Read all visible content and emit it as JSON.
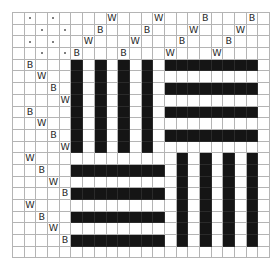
{
  "diagram": {
    "type": "weave-draft-grid",
    "grid": {
      "cols": 22,
      "rows": 21,
      "cell_px": 11.7,
      "line_color": "#b4b4b4",
      "fill_color": "#151515"
    },
    "dots": [
      [
        0,
        1
      ],
      [
        0,
        3
      ],
      [
        1,
        2
      ],
      [
        1,
        4
      ],
      [
        2,
        1
      ],
      [
        2,
        3
      ],
      [
        3,
        2
      ],
      [
        3,
        4
      ]
    ],
    "letters": [
      {
        "row": 0,
        "col": 8,
        "text": "W"
      },
      {
        "row": 0,
        "col": 12,
        "text": "W"
      },
      {
        "row": 0,
        "col": 16,
        "text": "B"
      },
      {
        "row": 0,
        "col": 20,
        "text": "B"
      },
      {
        "row": 1,
        "col": 7,
        "text": "B"
      },
      {
        "row": 1,
        "col": 11,
        "text": "B"
      },
      {
        "row": 1,
        "col": 15,
        "text": "W"
      },
      {
        "row": 1,
        "col": 19,
        "text": "W"
      },
      {
        "row": 2,
        "col": 6,
        "text": "W"
      },
      {
        "row": 2,
        "col": 10,
        "text": "W"
      },
      {
        "row": 2,
        "col": 14,
        "text": "B"
      },
      {
        "row": 2,
        "col": 18,
        "text": "B"
      },
      {
        "row": 3,
        "col": 5,
        "text": "B"
      },
      {
        "row": 3,
        "col": 9,
        "text": "B"
      },
      {
        "row": 3,
        "col": 13,
        "text": "W"
      },
      {
        "row": 3,
        "col": 17,
        "text": "W"
      },
      {
        "row": 4,
        "col": 1,
        "text": "B"
      },
      {
        "row": 5,
        "col": 2,
        "text": "W"
      },
      {
        "row": 6,
        "col": 3,
        "text": "B"
      },
      {
        "row": 7,
        "col": 4,
        "text": "W"
      },
      {
        "row": 8,
        "col": 1,
        "text": "B"
      },
      {
        "row": 9,
        "col": 2,
        "text": "W"
      },
      {
        "row": 10,
        "col": 3,
        "text": "B"
      },
      {
        "row": 11,
        "col": 4,
        "text": "W"
      },
      {
        "row": 12,
        "col": 1,
        "text": "W"
      },
      {
        "row": 13,
        "col": 2,
        "text": "B"
      },
      {
        "row": 14,
        "col": 3,
        "text": "W"
      },
      {
        "row": 15,
        "col": 4,
        "text": "B"
      },
      {
        "row": 16,
        "col": 1,
        "text": "W"
      },
      {
        "row": 17,
        "col": 2,
        "text": "B"
      },
      {
        "row": 18,
        "col": 3,
        "text": "W"
      },
      {
        "row": 19,
        "col": 4,
        "text": "B"
      }
    ],
    "blocks": [
      {
        "name": "top-left-vertical-bars",
        "orientation": "vertical",
        "rows": [
          4,
          11
        ],
        "cols": [
          5,
          7,
          9,
          11
        ]
      },
      {
        "name": "top-right-horizontal-bars",
        "orientation": "horizontal",
        "cols": [
          13,
          20
        ],
        "rows": [
          4,
          6,
          8,
          10
        ]
      },
      {
        "name": "bottom-left-horizontal-bars",
        "orientation": "horizontal",
        "cols": [
          5,
          12
        ],
        "rows": [
          13,
          15,
          17,
          19
        ]
      },
      {
        "name": "bottom-right-vertical-bars",
        "orientation": "vertical",
        "rows": [
          12,
          19
        ],
        "cols": [
          14,
          16,
          18,
          20
        ]
      }
    ]
  }
}
